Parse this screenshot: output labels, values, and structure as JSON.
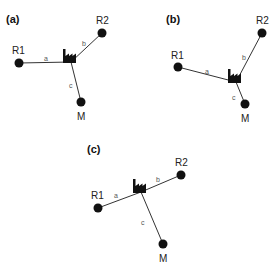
{
  "panels": [
    {
      "id": "a",
      "label": "(a)",
      "label_pos": [
        6,
        23
      ],
      "factory": [
        71,
        62
      ],
      "nodes": [
        {
          "name": "R1",
          "pos": [
            19,
            63
          ],
          "label_pos": [
            12,
            54
          ]
        },
        {
          "name": "R2",
          "pos": [
            102,
            33
          ],
          "label_pos": [
            96,
            24
          ]
        },
        {
          "name": "M",
          "pos": [
            81,
            102
          ],
          "label_pos": [
            77,
            120
          ]
        }
      ],
      "edges": [
        {
          "label": "a",
          "to": "R1",
          "label_pos": [
            44,
            61
          ]
        },
        {
          "label": "b",
          "to": "R2",
          "label_pos": [
            82,
            46
          ]
        },
        {
          "label": "c",
          "to": "M",
          "label_pos": [
            69,
            88
          ]
        }
      ]
    },
    {
      "id": "b",
      "label": "(b)",
      "label_pos": [
        166,
        23
      ],
      "factory": [
        236,
        82
      ],
      "nodes": [
        {
          "name": "R1",
          "pos": [
            178,
            67
          ],
          "label_pos": [
            171,
            59
          ]
        },
        {
          "name": "R2",
          "pos": [
            262,
            33
          ],
          "label_pos": [
            256,
            24
          ]
        },
        {
          "name": "M",
          "pos": [
            245,
            104
          ],
          "label_pos": [
            241,
            122
          ]
        }
      ],
      "edges": [
        {
          "label": "a",
          "to": "R1",
          "label_pos": [
            205,
            74
          ]
        },
        {
          "label": "b",
          "to": "R2",
          "label_pos": [
            242,
            60
          ]
        },
        {
          "label": "c",
          "to": "M",
          "label_pos": [
            232,
            100
          ]
        }
      ]
    },
    {
      "id": "c",
      "label": "(c)",
      "label_pos": [
        87,
        153
      ],
      "factory": [
        141,
        192
      ],
      "nodes": [
        {
          "name": "R1",
          "pos": [
            98,
            208
          ],
          "label_pos": [
            91,
            199
          ]
        },
        {
          "name": "R2",
          "pos": [
            181,
            175
          ],
          "label_pos": [
            175,
            166
          ]
        },
        {
          "name": "M",
          "pos": [
            163,
            244
          ],
          "label_pos": [
            159,
            262
          ]
        }
      ],
      "edges": [
        {
          "label": "a",
          "to": "R1",
          "label_pos": [
            114,
            198
          ]
        },
        {
          "label": "b",
          "to": "R2",
          "label_pos": [
            156,
            182
          ]
        },
        {
          "label": "c",
          "to": "M",
          "label_pos": [
            141,
            225
          ]
        }
      ]
    }
  ]
}
